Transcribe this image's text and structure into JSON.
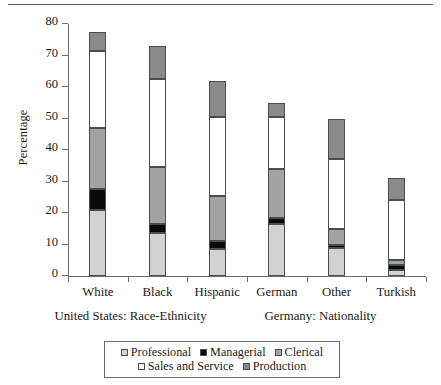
{
  "chart_data": {
    "type": "bar",
    "subtype": "stacked-bar",
    "title": "",
    "xlabel": "",
    "ylabel": "Percentage",
    "ylim": [
      0,
      80
    ],
    "ytick_labels": [
      "0",
      "10",
      "20",
      "30",
      "40",
      "50",
      "60",
      "70",
      "80"
    ],
    "yticks": [
      0,
      10,
      20,
      30,
      40,
      50,
      60,
      70,
      80
    ],
    "grid": false,
    "legend_position": "bottom",
    "categories": [
      "White",
      "Black",
      "Hispanic",
      "German",
      "Other",
      "Turkish"
    ],
    "group_labels": [
      "United States: Race-Ethnicity",
      "Germany: Nationality"
    ],
    "group_spans": [
      [
        "White",
        "Black",
        "Hispanic"
      ],
      [
        "German",
        "Other",
        "Turkish"
      ]
    ],
    "series": [
      {
        "name": "Professional",
        "color": "#d2d2d2",
        "values": [
          21.0,
          13.5,
          8.5,
          16.5,
          9.0,
          2.0
        ]
      },
      {
        "name": "Managerial",
        "color": "#0a0a0a",
        "values": [
          6.5,
          3.0,
          2.5,
          2.0,
          1.0,
          1.5
        ]
      },
      {
        "name": "Clerical",
        "color": "#a3a3a3",
        "values": [
          19.5,
          18.0,
          14.5,
          15.5,
          5.0,
          1.5
        ]
      },
      {
        "name": "Sales and Service",
        "color": "#ffffff",
        "values": [
          24.5,
          28.0,
          25.0,
          16.5,
          22.0,
          19.0
        ]
      },
      {
        "name": "Production",
        "color": "#8a8a8a",
        "values": [
          6.0,
          10.5,
          11.5,
          4.5,
          13.0,
          7.0
        ]
      }
    ],
    "totals": [
      77.5,
      73.0,
      62.0,
      55.0,
      50.0,
      31.0
    ],
    "legend_entries": [
      "Professional",
      "Managerial",
      "Clerical",
      "Sales and Service",
      "Production"
    ]
  },
  "axis": {
    "y_title": "Percentage"
  },
  "legend": {
    "row1": [
      "Professional",
      "Managerial",
      "Clerical"
    ],
    "row2": [
      "Sales and Service",
      "Production"
    ]
  },
  "groups": {
    "us": "United States: Race-Ethnicity",
    "de": "Germany: Nationality"
  }
}
